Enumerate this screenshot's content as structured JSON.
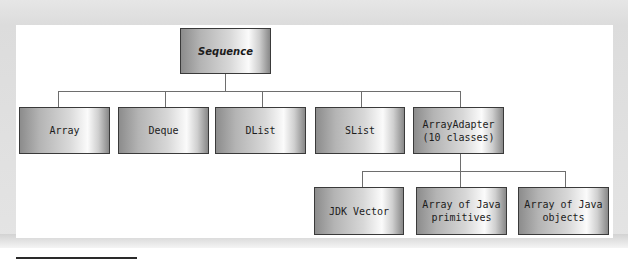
{
  "diagram": {
    "root": {
      "label": "Sequence"
    },
    "level1": [
      {
        "label": "Array"
      },
      {
        "label": "Deque"
      },
      {
        "label": "DList"
      },
      {
        "label": "SList"
      },
      {
        "label": "ArrayAdapter\n(10 classes)"
      }
    ],
    "level2_parent": "ArrayAdapter\n(10 classes)",
    "level2": [
      {
        "label": "JDK Vector"
      },
      {
        "label": "Array of Java\nprimitives"
      },
      {
        "label": "Array of Java\nobjects"
      }
    ],
    "colors": {
      "box_border": "#3a3a3a",
      "connector": "#6e6e6e",
      "gradient_dark": "#8c8c8c",
      "gradient_light": "#fbfbfb",
      "panel_bg": "#ffffff",
      "frame_bg": "#e0e0e0"
    }
  }
}
